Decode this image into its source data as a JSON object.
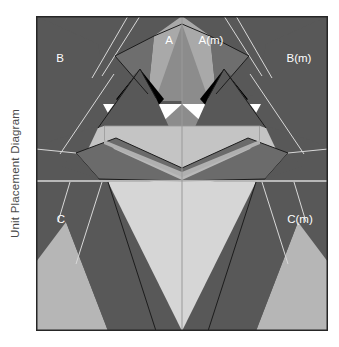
{
  "caption": {
    "text": "Unit Placement Diagram"
  },
  "colors": {
    "page_background": "#ffffff",
    "frame_border": "#262626",
    "background_dark_gray": "#585858",
    "mid_gray": "#6f6f6f",
    "light_gray": "#c4c4c4",
    "pale_gray": "#d6d6d6",
    "medium_light_gray": "#b6b6b6",
    "black_patch": "#000000",
    "white_patch": "#ffffff",
    "guide_line_light": "#d8d8d8",
    "outline_dark": "#1c1c1c",
    "label_text": "#ffffff",
    "caption_text": "#4a4a4a"
  },
  "diagram": {
    "title": "Unit Placement Diagram",
    "frame": {
      "x": 36,
      "y": 16,
      "width": 292,
      "height": 315
    },
    "center_x_ratio": 0.5,
    "divider_y_ratio": 0.525,
    "labels": [
      {
        "id": "label-a",
        "text": "A",
        "x_ratio": 0.455,
        "y_ratio": 0.075
      },
      {
        "id": "label-a-m",
        "text": "A(m)",
        "x_ratio": 0.59,
        "y_ratio": 0.075
      },
      {
        "id": "label-b",
        "text": "B",
        "x_ratio": 0.08,
        "y_ratio": 0.135
      },
      {
        "id": "label-b-m",
        "text": "B(m)",
        "x_ratio": 0.845,
        "y_ratio": 0.135
      },
      {
        "id": "label-c",
        "text": "C",
        "x_ratio": 0.08,
        "y_ratio": 0.65
      },
      {
        "id": "label-c-m",
        "text": "C(m)",
        "x_ratio": 0.845,
        "y_ratio": 0.65
      }
    ],
    "units": [
      {
        "id": "unit-a",
        "label": "A",
        "side": "left",
        "section": "top"
      },
      {
        "id": "unit-a-m",
        "label": "A(m)",
        "side": "right",
        "section": "top"
      },
      {
        "id": "unit-b",
        "label": "B",
        "side": "left",
        "section": "top"
      },
      {
        "id": "unit-b-m",
        "label": "B(m)",
        "side": "right",
        "section": "top"
      },
      {
        "id": "unit-c",
        "label": "C",
        "side": "left",
        "section": "bottom"
      },
      {
        "id": "unit-c-m",
        "label": "C(m)",
        "side": "right",
        "section": "bottom"
      }
    ]
  }
}
